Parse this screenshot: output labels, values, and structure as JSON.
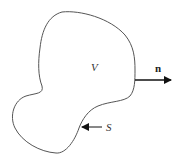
{
  "diagram": {
    "region_label": "V",
    "surface_label": "S",
    "normal_label": "n",
    "colors": {
      "outline": "#555555",
      "arrow": "#111111",
      "text": "#333333",
      "background": "#ffffff"
    }
  }
}
